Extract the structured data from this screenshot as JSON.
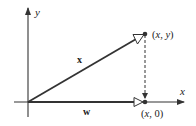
{
  "diagram": {
    "type": "vector-projection",
    "colors": {
      "line": "#333333",
      "background": "#ffffff"
    },
    "axes": {
      "x_label": "x",
      "y_label": "y"
    },
    "vectors": {
      "x": {
        "label": "x",
        "from": "origin",
        "to": "(x, y)"
      },
      "w": {
        "label": "w",
        "from": "origin",
        "to": "(x, 0)"
      }
    },
    "points": {
      "tip": {
        "x_var": "x",
        "y_var": "y",
        "prefix": "(",
        "sep": ", ",
        "suffix": ")"
      },
      "foot": {
        "x_var": "x",
        "y_val": "0",
        "prefix": "(",
        "sep": ", ",
        "suffix": ")"
      }
    },
    "projection_line": "dashed"
  }
}
